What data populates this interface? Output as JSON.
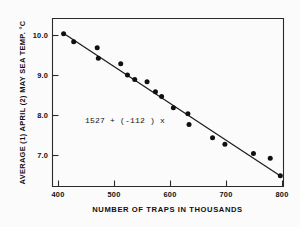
{
  "chart_data": {
    "type": "scatter",
    "title": "",
    "xlabel": "NUMBER OF TRAPS IN THOUSANDS",
    "ylabel": "AVERAGE (1) APRIL (2) MAY SEA TEMP. °C",
    "xlim": [
      380,
      820
    ],
    "ylim": [
      6.2,
      10.45
    ],
    "xticks": [
      400,
      500,
      600,
      700,
      800
    ],
    "xticklabels": [
      "400",
      "500",
      "600",
      "700",
      "800"
    ],
    "yticks": [
      7.0,
      8.0,
      9.0,
      10.0
    ],
    "yticklabels": [
      "7.0",
      "8.0",
      "9.0",
      "10.0"
    ],
    "grid": false,
    "legend": null,
    "annotations": [
      {
        "text": "1527 + (-112 ) x",
        "x": 468,
        "y": 7.75
      }
    ],
    "series": [
      {
        "name": "observations",
        "type": "scatter",
        "marker": "filled-circle",
        "color": "#101010",
        "points": [
          {
            "x": 410,
            "y": 10.03
          },
          {
            "x": 428,
            "y": 9.83
          },
          {
            "x": 470,
            "y": 9.68
          },
          {
            "x": 472,
            "y": 9.42
          },
          {
            "x": 512,
            "y": 9.28
          },
          {
            "x": 524,
            "y": 9.0
          },
          {
            "x": 537,
            "y": 8.89
          },
          {
            "x": 559,
            "y": 8.83
          },
          {
            "x": 574,
            "y": 8.58
          },
          {
            "x": 585,
            "y": 8.46
          },
          {
            "x": 606,
            "y": 8.18
          },
          {
            "x": 632,
            "y": 8.03
          },
          {
            "x": 634,
            "y": 7.76
          },
          {
            "x": 676,
            "y": 7.43
          },
          {
            "x": 698,
            "y": 7.27
          },
          {
            "x": 749,
            "y": 7.04
          },
          {
            "x": 779,
            "y": 6.92
          },
          {
            "x": 797,
            "y": 6.48
          }
        ]
      },
      {
        "name": "regression-line",
        "type": "line",
        "color": "#1a1a1a",
        "equation": "1527 + (-112 ) x",
        "endpoints": [
          {
            "x": 409,
            "y": 10.05
          },
          {
            "x": 798,
            "y": 6.47
          }
        ]
      }
    ]
  },
  "axes": {
    "frame": {
      "left_px": 52,
      "right_px": 283,
      "top_px": 18,
      "bottom_px": 186
    }
  }
}
